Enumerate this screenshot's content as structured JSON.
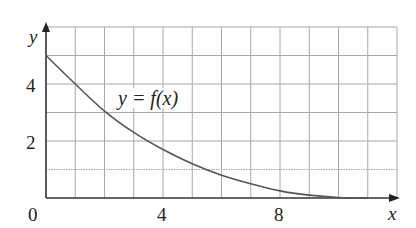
{
  "chart_data": {
    "type": "line",
    "title": "",
    "xlabel": "x",
    "ylabel": "y",
    "xlim": [
      0,
      12
    ],
    "ylim": [
      0,
      6
    ],
    "grid": true,
    "x_ticks": [
      0,
      4,
      8
    ],
    "y_ticks": [
      2,
      4
    ],
    "origin_label": "0",
    "annotation": "y = f(x)",
    "series": [
      {
        "name": "f(x)",
        "x": [
          0,
          1,
          2,
          3,
          4,
          5,
          6,
          7,
          8,
          9,
          10,
          11
        ],
        "y": [
          5,
          4,
          3.05,
          2.3,
          1.7,
          1.2,
          0.8,
          0.5,
          0.25,
          0.1,
          0.02,
          0
        ]
      }
    ],
    "colors": {
      "curve": "#555555",
      "grid": "#a8a8a8",
      "axis": "#333333"
    }
  },
  "labels": {
    "y_axis": "y",
    "x_axis": "x",
    "origin": "0",
    "tick_x_4": "4",
    "tick_x_8": "8",
    "tick_y_2": "2",
    "tick_y_4": "4",
    "curve_label": "y = f(x)"
  }
}
